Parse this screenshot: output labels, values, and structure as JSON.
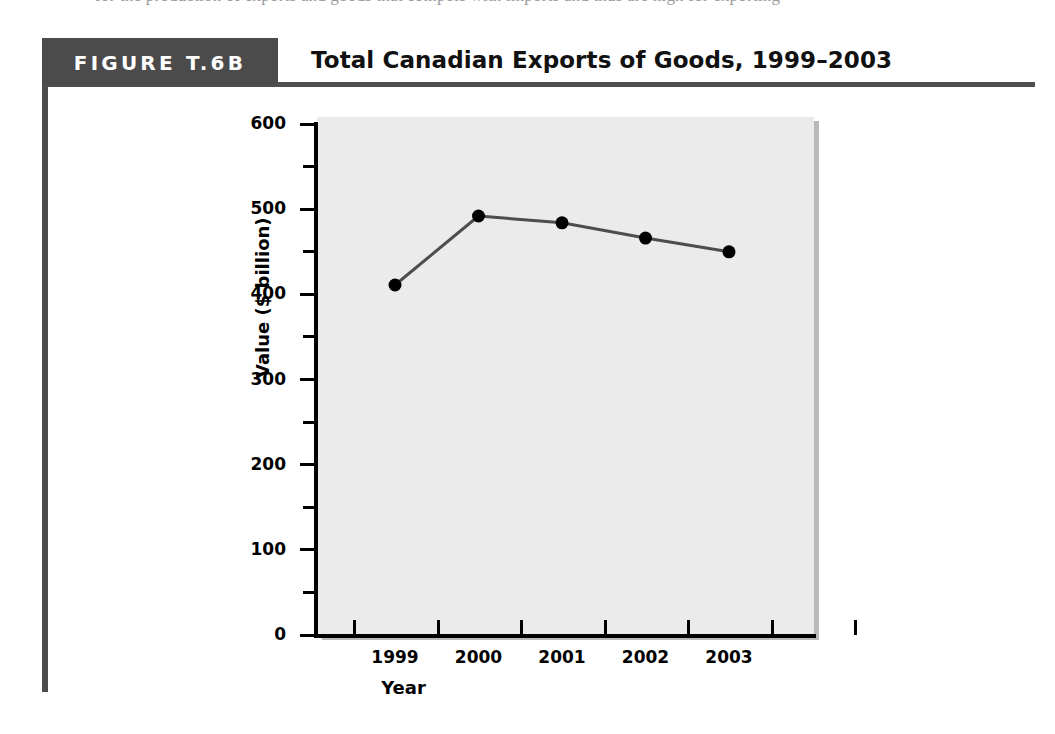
{
  "top_bleed": {
    "text": "for the production of exports and goods that compete with imports and thus are high for exporting"
  },
  "figure": {
    "tag_label": "FIGURE T.6B",
    "title": "Total Canadian Exports of Goods, 1999–2003",
    "tag_bg_color": "#4b4b4b",
    "rule_color": "#4e4e4e"
  },
  "chart_data": {
    "type": "line",
    "title": "Total Canadian Exports of Goods, 1999–2003",
    "xlabel": "Year",
    "ylabel": "Value ($ billion)",
    "categories": [
      "1999",
      "2000",
      "2001",
      "2002",
      "2003"
    ],
    "values": [
      411,
      492,
      484,
      466,
      450
    ],
    "series": [
      {
        "name": "Total Canadian exports of goods",
        "values": [
          411,
          492,
          484,
          466,
          450
        ]
      }
    ],
    "ylim": [
      0,
      600
    ],
    "y_major_ticks": [
      0,
      100,
      200,
      300,
      400,
      500,
      600
    ],
    "y_minor_ticks": [
      50,
      150,
      250,
      350,
      450,
      550
    ],
    "y_tick_labels": [
      "0",
      "100",
      "200",
      "300",
      "400",
      "500",
      "600"
    ],
    "x_tick_labels": [
      "1999",
      "2000",
      "2001",
      "2002",
      "2003"
    ],
    "grid": false,
    "legend": "none",
    "plot_background_color": "#ebebeb",
    "line_color": "#4d4d4d",
    "marker_color": "#000000",
    "marker_shape": "circle"
  }
}
